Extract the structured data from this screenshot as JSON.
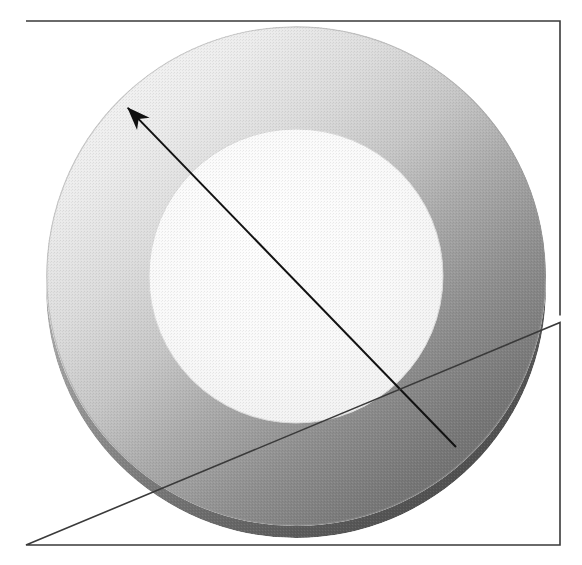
{
  "figure": {
    "kind": "scanned-line-art-illustration",
    "canvas": {
      "width": 582,
      "height": 565,
      "background": "#ffffff"
    }
  },
  "frame": {
    "name": "image-border",
    "x": 26,
    "y": 21,
    "width": 534,
    "height": 524,
    "stroke": "#3a3a3a",
    "stroke_width": 1.6,
    "fill": "#ffffff",
    "gap": {
      "side": "right",
      "y": 319,
      "length": 7
    }
  },
  "shapes": {
    "outer_disk": {
      "name": "annulus-outer-top-face",
      "cx": 296,
      "cy": 276,
      "r": 250,
      "gradient": {
        "type": "linear",
        "angle_from": "top-left",
        "stops": [
          {
            "offset": 0.0,
            "color": "#f5f5f5"
          },
          {
            "offset": 0.18,
            "color": "#eaeaea"
          },
          {
            "offset": 0.34,
            "color": "#d8d8d8"
          },
          {
            "offset": 0.5,
            "color": "#bdbdbd"
          },
          {
            "offset": 0.66,
            "color": "#9a9a9a"
          },
          {
            "offset": 0.82,
            "color": "#7c7c7c"
          },
          {
            "offset": 1.0,
            "color": "#666666"
          }
        ]
      }
    },
    "side_wall": {
      "name": "annulus-extruded-side-wall",
      "cx": 296,
      "cy": 288,
      "r": 250,
      "thickness": 13,
      "gradient": {
        "stops": [
          {
            "offset": 0.0,
            "color": "#cfcfcf"
          },
          {
            "offset": 0.4,
            "color": "#8d8d8d"
          },
          {
            "offset": 0.72,
            "color": "#5e5e5e"
          },
          {
            "offset": 1.0,
            "color": "#4a4a4a"
          }
        ]
      }
    },
    "inner_hole": {
      "name": "annulus-inner-hole",
      "cx": 296,
      "cy": 276,
      "r": 147,
      "gradient": {
        "stops": [
          {
            "offset": 0.0,
            "color": "#fdfdfd"
          },
          {
            "offset": 0.55,
            "color": "#f8f8f8"
          },
          {
            "offset": 1.0,
            "color": "#efefef"
          }
        ]
      }
    }
  },
  "arrow": {
    "name": "direction-arrow",
    "tail": {
      "x": 456,
      "y": 447
    },
    "tip": {
      "x": 125,
      "y": 105
    },
    "stroke": "#111111",
    "stroke_width": 2.0,
    "head": {
      "style": "barbed",
      "length": 26,
      "half_width": 7
    },
    "angle_deg": 134
  },
  "texture": {
    "name": "halftone-scan-grain",
    "enabled": true,
    "cell": 3,
    "opacity": 0.13
  },
  "palette": {
    "paper": "#ffffff",
    "border": "#3a3a3a",
    "highlight": "#f5f5f5",
    "midtone": "#bdbdbd",
    "shadow": "#666666",
    "deep_shadow": "#4a4a4a",
    "ink": "#111111"
  }
}
